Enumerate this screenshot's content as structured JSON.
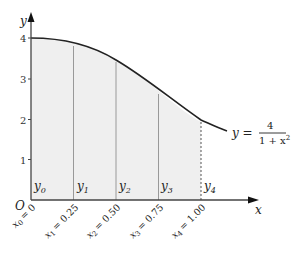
{
  "figure": {
    "axes": {
      "x_label": "x",
      "y_label": "y",
      "origin_label": "O",
      "y_ticks": [
        "1",
        "2",
        "3",
        "4"
      ]
    },
    "curve_label": {
      "lhs": "y =",
      "numerator": "4",
      "denominator_base": "1 + x",
      "denominator_exp": "2"
    },
    "strips": [
      {
        "y_label": "y",
        "y_sub": "0",
        "x_label": "x",
        "x_sub": "0",
        "x_value": "= 0"
      },
      {
        "y_label": "y",
        "y_sub": "1",
        "x_label": "x",
        "x_sub": "1",
        "x_value": "= 0.25"
      },
      {
        "y_label": "y",
        "y_sub": "2",
        "x_label": "x",
        "x_sub": "2",
        "x_value": "= 0.50"
      },
      {
        "y_label": "y",
        "y_sub": "3",
        "x_label": "x",
        "x_sub": "3",
        "x_value": "= 0.75"
      },
      {
        "y_label": "y",
        "y_sub": "4",
        "x_label": "x",
        "x_sub": "4",
        "x_value": "= 1.00"
      }
    ],
    "colors": {
      "fill": "#efefef",
      "curve": "#222222",
      "axis": "#444444",
      "ordinate": "#888888"
    }
  }
}
